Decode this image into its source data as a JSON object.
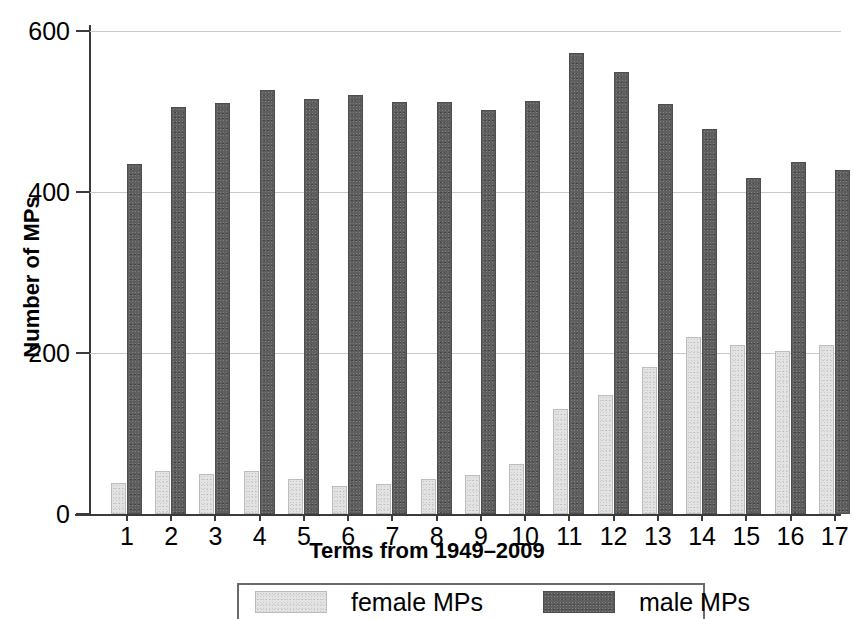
{
  "chart_data": {
    "type": "bar",
    "title": "",
    "xlabel": "Terms from 1949–2009",
    "ylabel": "Number of MPs",
    "categories": [
      "1",
      "2",
      "3",
      "4",
      "5",
      "6",
      "7",
      "8",
      "9",
      "10",
      "11",
      "12",
      "13",
      "14",
      "15",
      "16",
      "17"
    ],
    "series": [
      {
        "name": "female MPs",
        "color": "#e3e3e3",
        "values": [
          39,
          53,
          50,
          53,
          43,
          35,
          37,
          43,
          49,
          62,
          130,
          148,
          183,
          220,
          210,
          202,
          210
        ]
      },
      {
        "name": "male MPs",
        "color": "#5e5e5e",
        "values": [
          435,
          505,
          511,
          527,
          515,
          521,
          512,
          512,
          502,
          513,
          573,
          549,
          509,
          478,
          418,
          437,
          427
        ]
      }
    ],
    "ylim": [
      0,
      600
    ],
    "yticks": [
      0,
      200,
      400,
      600
    ],
    "ytick_labels": [
      "0",
      "200",
      "400",
      "600"
    ],
    "grid": "horizontal",
    "legend_position": "bottom",
    "axis_color": "#3a3a3a",
    "grid_color": "#c9c9c9",
    "background": "#ffffff"
  }
}
